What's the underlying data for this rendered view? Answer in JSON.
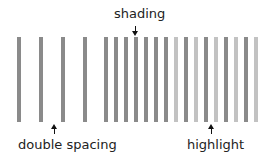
{
  "labels": {
    "shading": "shading",
    "double_spacing": "double spacing",
    "highlight": "highlight"
  },
  "colors": {
    "dark_bar": "#8a8a8a",
    "light_bar": "#c2c2c2",
    "text": "#222222",
    "arrow": "#111111"
  },
  "bars": [
    {
      "x": 17,
      "shade": "dark"
    },
    {
      "x": 39,
      "shade": "dark"
    },
    {
      "x": 61,
      "shade": "dark"
    },
    {
      "x": 83,
      "shade": "dark"
    },
    {
      "x": 104,
      "shade": "dark"
    },
    {
      "x": 114,
      "shade": "dark"
    },
    {
      "x": 124,
      "shade": "dark"
    },
    {
      "x": 134,
      "shade": "dark"
    },
    {
      "x": 144,
      "shade": "dark"
    },
    {
      "x": 154,
      "shade": "dark"
    },
    {
      "x": 164,
      "shade": "dark"
    },
    {
      "x": 174,
      "shade": "light"
    },
    {
      "x": 184,
      "shade": "dark"
    },
    {
      "x": 194,
      "shade": "light"
    },
    {
      "x": 204,
      "shade": "dark"
    },
    {
      "x": 214,
      "shade": "light"
    },
    {
      "x": 224,
      "shade": "dark"
    },
    {
      "x": 234,
      "shade": "light"
    },
    {
      "x": 244,
      "shade": "dark"
    },
    {
      "x": 254,
      "shade": "light"
    }
  ]
}
